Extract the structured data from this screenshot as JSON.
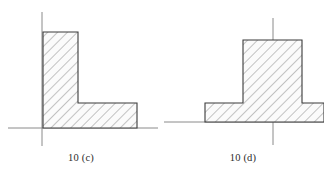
{
  "sheet": {
    "title": "Cross-section figures 10 (c) and 10 (d)",
    "background_color": "#ffffff",
    "width": 324,
    "height": 176
  },
  "style": {
    "outline_color": "#3a3a3a",
    "hatch_color": "#6b6b6b",
    "fill_color": "#fbfbfb",
    "axis_color": "#8a8a8a",
    "caption_color": "#2b2b2b",
    "outline_width": 1.1,
    "axis_width": 1.0,
    "hatch_width": 0.8,
    "hatch_spacing": 7,
    "hatch_angle_deg": 45
  },
  "figures": [
    {
      "id": "figure-c",
      "caption": "10 (c)",
      "shape_name": "l-shaped-angle-section",
      "shape_type": "L-section",
      "axes": {
        "vertical_axis": {
          "x": 42,
          "y_top": 12,
          "y_bottom": 146
        },
        "horizontal_axis": {
          "y": 128,
          "x_left": 8,
          "x_right": 158
        }
      },
      "outline_points": "43,32 78,32 78,103 137,103 137,128 43,128",
      "dimensions": {
        "flange_top_y": 32,
        "web_left_x": 43,
        "web_right_x": 78,
        "foot_top_y": 103,
        "foot_right_x": 137,
        "base_y": 128
      }
    },
    {
      "id": "figure-d",
      "caption": "10 (d)",
      "shape_name": "inverted-t-section",
      "shape_type": "T-section (inverted)",
      "axes": {
        "vertical_axis": {
          "x": 273,
          "y_top": 18,
          "y_bottom": 145
        },
        "horizontal_axis": {
          "y": 122,
          "x_left": 164,
          "x_right": 324
        }
      },
      "outline_points": "243,40 302,40 302,103 324,103 324,122 205,122 205,103 243,103",
      "dimensions": {
        "stem_top_y": 40,
        "stem_left_x": 243,
        "stem_right_x": 302,
        "base_top_y": 103,
        "base_left_x": 205,
        "base_right_x": 324,
        "base_bottom_y": 122
      }
    }
  ]
}
